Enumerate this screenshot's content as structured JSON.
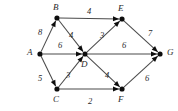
{
  "figure": {
    "type": "directed-weighted-graph",
    "background_color": "#ffffff",
    "node_color": "#0d0d0d",
    "edge_color": "#4a4a4a",
    "label_color": "#2b2b2b",
    "width": 178,
    "height": 111
  },
  "nodes": [
    {
      "id": "A",
      "label": "A",
      "x": 40,
      "y": 54,
      "label_x": 27,
      "label_y": 48
    },
    {
      "id": "B",
      "label": "B",
      "x": 57,
      "y": 18,
      "label_x": 53,
      "label_y": 3
    },
    {
      "id": "C",
      "label": "C",
      "x": 57,
      "y": 89,
      "label_x": 53,
      "label_y": 95
    },
    {
      "id": "D",
      "label": "D",
      "x": 85,
      "y": 54,
      "label_x": 81,
      "label_y": 60
    },
    {
      "id": "E",
      "label": "E",
      "x": 122,
      "y": 19,
      "label_x": 118,
      "label_y": 4
    },
    {
      "id": "F",
      "label": "F",
      "x": 122,
      "y": 89,
      "label_x": 118,
      "label_y": 95
    },
    {
      "id": "G",
      "label": "G",
      "x": 160,
      "y": 54,
      "label_x": 167,
      "label_y": 48
    }
  ],
  "edges": [
    {
      "from": "A",
      "to": "B",
      "weight": "8",
      "label_x": 38,
      "label_y": 28
    },
    {
      "from": "A",
      "to": "D",
      "weight": "6",
      "label_x": 58,
      "label_y": 41
    },
    {
      "from": "A",
      "to": "C",
      "weight": "5",
      "label_x": 38,
      "label_y": 74
    },
    {
      "from": "B",
      "to": "E",
      "weight": "4",
      "label_x": 87,
      "label_y": 7
    },
    {
      "from": "B",
      "to": "D",
      "weight": "4",
      "label_x": 69,
      "label_y": 31
    },
    {
      "from": "C",
      "to": "D",
      "weight": "3",
      "label_x": 66,
      "label_y": 71
    },
    {
      "from": "C",
      "to": "F",
      "weight": "2",
      "label_x": 88,
      "label_y": 97
    },
    {
      "from": "D",
      "to": "E",
      "weight": "3",
      "label_x": 100,
      "label_y": 31
    },
    {
      "from": "D",
      "to": "G",
      "weight": "6",
      "label_x": 122,
      "label_y": 41
    },
    {
      "from": "D",
      "to": "F",
      "weight": "4",
      "label_x": 105,
      "label_y": 71
    },
    {
      "from": "E",
      "to": "G",
      "weight": "7",
      "label_x": 148,
      "label_y": 29
    },
    {
      "from": "F",
      "to": "G",
      "weight": "6",
      "label_x": 145,
      "label_y": 74
    }
  ]
}
